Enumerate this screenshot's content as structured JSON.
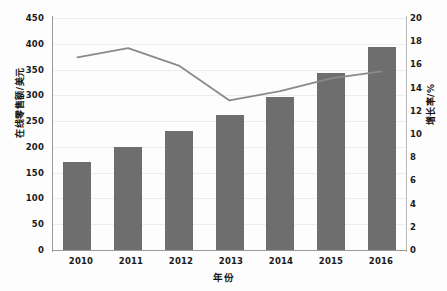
{
  "chart_data": {
    "type": "bar",
    "title": "",
    "xlabel": "年份",
    "ylabel": "在线零售额/美元",
    "y2label": "增长率/%",
    "categories": [
      "2010",
      "2011",
      "2012",
      "2013",
      "2014",
      "2015",
      "2016"
    ],
    "ylim": [
      0,
      450
    ],
    "y2lim": [
      0,
      20
    ],
    "yticks": [
      "450",
      "400",
      "350",
      "300",
      "250",
      "200",
      "150",
      "100",
      "50",
      "0"
    ],
    "y2ticks": [
      "20",
      "18",
      "16",
      "14",
      "12",
      "10",
      "8",
      "6",
      "4",
      "2",
      "0"
    ],
    "grid": true,
    "legend": "none",
    "series": [
      {
        "name": "在线零售额/美元",
        "type": "bar",
        "axis": "left",
        "color": "#6e6e6e",
        "values": [
          171,
          200,
          230,
          262,
          297,
          344,
          393
        ]
      },
      {
        "name": "增长率/%",
        "type": "line",
        "axis": "right",
        "color": "#8a8a8a",
        "values": [
          16.6,
          17.4,
          15.9,
          12.9,
          13.7,
          14.8,
          15.4
        ]
      }
    ]
  },
  "axes": {
    "left_title": "在线零售额/美元",
    "right_title": "增长率/%",
    "bottom_title": "年份"
  }
}
